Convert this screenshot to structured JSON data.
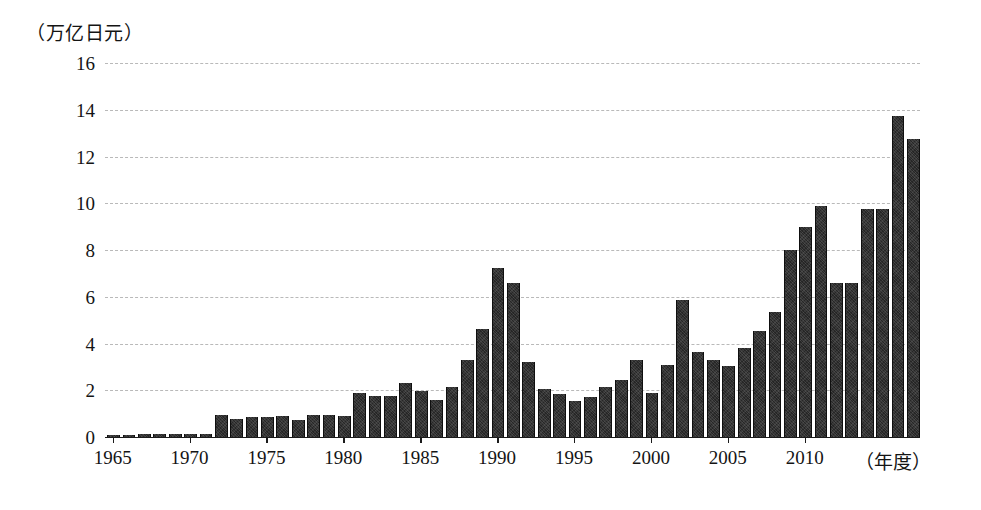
{
  "chart_data": {
    "type": "bar",
    "title": "",
    "subtitle": "",
    "ylabel": "（万亿日元）",
    "xlabel": "（年度）",
    "ylim": [
      0,
      16
    ],
    "ytick_step": 2,
    "ytick_labels": [
      "0",
      "2",
      "4",
      "6",
      "8",
      "10",
      "12",
      "14",
      "16"
    ],
    "xtick_labels": [
      "1965",
      "1970",
      "1975",
      "1980",
      "1985",
      "1990",
      "1995",
      "2000",
      "2005",
      "2010"
    ],
    "xlim": [
      1964.2,
      2013.8
    ],
    "grid": "horizontal-dashed",
    "legend": "none",
    "bar_color": "#262626",
    "categories": [
      "1965",
      "1966",
      "1967",
      "1968",
      "1969",
      "1970",
      "1971",
      "1972",
      "1973",
      "1974",
      "1975",
      "1976",
      "1977",
      "1978",
      "1979",
      "1980",
      "1981",
      "1982",
      "1983",
      "1984",
      "1985",
      "1986",
      "1987",
      "1988",
      "1989",
      "1990",
      "1991",
      "1992",
      "1993",
      "1994",
      "1995",
      "1996",
      "1997",
      "1998",
      "1999",
      "2000",
      "2001",
      "2002",
      "2003",
      "2004",
      "2005",
      "2006",
      "2007",
      "2008",
      "2009",
      "2010",
      "2011",
      "2012",
      "2013"
    ],
    "values": [
      0.07,
      0.08,
      0.12,
      0.12,
      0.12,
      0.13,
      0.15,
      0.95,
      0.75,
      0.85,
      0.85,
      0.9,
      0.72,
      0.93,
      0.95,
      0.88,
      1.9,
      1.75,
      1.75,
      2.3,
      1.95,
      1.6,
      2.15,
      3.3,
      4.6,
      7.25,
      6.6,
      3.2,
      2.05,
      1.85,
      1.55,
      1.7,
      2.15,
      2.45,
      3.3,
      1.9,
      3.1,
      5.85,
      3.65,
      3.3,
      3.05,
      3.8,
      4.55,
      5.35,
      8.0,
      9.0,
      9.9,
      6.6,
      6.6
    ],
    "series": [
      {
        "name": "value",
        "values": [
          0.07,
          0.08,
          0.12,
          0.12,
          0.12,
          0.13,
          0.15,
          0.95,
          0.75,
          0.85,
          0.85,
          0.9,
          0.72,
          0.93,
          0.95,
          0.88,
          1.9,
          1.75,
          1.75,
          2.3,
          1.95,
          1.6,
          2.15,
          3.3,
          4.6,
          7.25,
          6.6,
          3.2,
          2.05,
          1.85,
          1.55,
          1.7,
          2.15,
          2.45,
          3.3,
          1.9,
          3.1,
          5.85,
          3.65,
          3.3,
          3.05,
          3.8,
          4.55,
          5.35,
          8.0,
          9.0,
          9.9,
          6.6,
          6.6
        ]
      }
    ],
    "extra_trailing_values": [
      9.75,
      9.75,
      13.75,
      12.75
    ],
    "full_values_with_trailing": [
      0.07,
      0.08,
      0.12,
      0.12,
      0.12,
      0.13,
      0.15,
      0.95,
      0.75,
      0.85,
      0.85,
      0.9,
      0.72,
      0.93,
      0.95,
      0.88,
      1.9,
      1.75,
      1.75,
      2.3,
      1.95,
      1.6,
      2.15,
      3.3,
      4.6,
      7.25,
      6.6,
      3.2,
      2.05,
      1.85,
      1.55,
      1.7,
      2.15,
      2.45,
      3.3,
      1.9,
      3.1,
      5.85,
      3.65,
      3.3,
      3.05,
      3.8,
      4.55,
      5.35,
      8.0,
      9.0,
      9.9,
      6.6,
      6.6,
      9.75,
      9.75,
      13.75,
      12.75
    ],
    "full_categories_with_trailing": [
      "1965",
      "1966",
      "1967",
      "1968",
      "1969",
      "1970",
      "1971",
      "1972",
      "1973",
      "1974",
      "1975",
      "1976",
      "1977",
      "1978",
      "1979",
      "1980",
      "1981",
      "1982",
      "1983",
      "1984",
      "1985",
      "1986",
      "1987",
      "1988",
      "1989",
      "1990",
      "1991",
      "1992",
      "1993",
      "1994",
      "1995",
      "1996",
      "1997",
      "1998",
      "1999",
      "2000",
      "2001",
      "2002",
      "2003",
      "2004",
      "2005",
      "2006",
      "2007",
      "2008",
      "2009",
      "2010",
      "2011",
      "2012",
      "2013"
    ]
  }
}
